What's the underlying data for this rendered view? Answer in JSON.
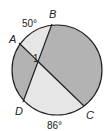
{
  "diagram": {
    "type": "circle-intersecting-chords",
    "points": {
      "A": "A",
      "B": "B",
      "C": "C",
      "D": "D"
    },
    "angle_label": "1",
    "arcs": {
      "AB": "50°",
      "DC": "86°"
    },
    "colors": {
      "dark_region": "#b3b3b3",
      "light_region": "#e6e6e6",
      "stroke": "#222222"
    }
  }
}
